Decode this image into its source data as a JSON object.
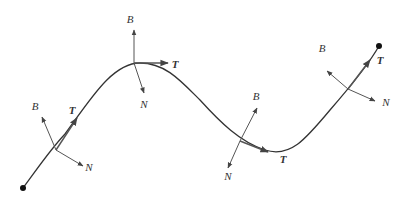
{
  "diagram": {
    "curve": {
      "start": [
        23,
        188
      ],
      "end": [
        379,
        46
      ],
      "color": "#333333"
    },
    "frames": [
      {
        "origin": [
          56,
          150
        ],
        "T": {
          "tip": [
            77,
            118
          ],
          "label": "T",
          "label_pos": [
            72,
            114
          ]
        },
        "N": {
          "tip": [
            83,
            166
          ],
          "label": "N",
          "label_pos": [
            89,
            171
          ]
        },
        "B": {
          "tip": [
            42,
            117
          ],
          "label": "B",
          "label_pos": [
            35,
            110
          ]
        }
      },
      {
        "origin": [
          134,
          63
        ],
        "T": {
          "tip": [
            168,
            63
          ],
          "label": "T",
          "label_pos": [
            175,
            68
          ]
        },
        "N": {
          "tip": [
            144,
            93
          ],
          "label": "N",
          "label_pos": [
            144,
            108
          ]
        },
        "B": {
          "tip": [
            134,
            30
          ],
          "label": "B",
          "label_pos": [
            130,
            23
          ]
        }
      },
      {
        "origin": [
          240,
          141
        ],
        "T": {
          "tip": [
            268,
            152
          ],
          "label": "T",
          "label_pos": [
            283,
            163
          ]
        },
        "N": {
          "tip": [
            228,
            168
          ],
          "label": "N",
          "label_pos": [
            228,
            180
          ]
        },
        "B": {
          "tip": [
            257,
            108
          ],
          "label": "B",
          "label_pos": [
            256,
            100
          ]
        }
      },
      {
        "origin": [
          348,
          89
        ],
        "T": {
          "tip": [
            370,
            60
          ],
          "label": "T",
          "label_pos": [
            380,
            64
          ]
        },
        "N": {
          "tip": [
            375,
            101
          ],
          "label": "N",
          "label_pos": [
            386,
            106
          ]
        },
        "B": {
          "tip": [
            327,
            71
          ],
          "label": "B",
          "label_pos": [
            322,
            52
          ]
        }
      }
    ],
    "vector_color": "#555555"
  }
}
